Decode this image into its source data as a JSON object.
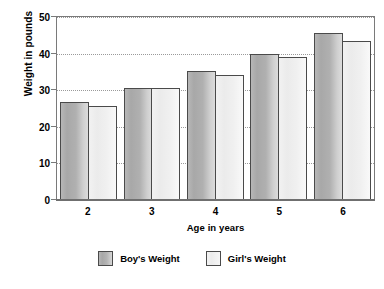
{
  "chart_data": {
    "type": "bar",
    "title": "",
    "xlabel": "Age in years",
    "ylabel": "Weight in pounds",
    "categories": [
      "2",
      "3",
      "4",
      "5",
      "6"
    ],
    "series": [
      {
        "name": "Boy's Weight",
        "values": [
          26.8,
          30.5,
          35.3,
          40.0,
          45.7
        ],
        "color": "#b0b0b0"
      },
      {
        "name": "Girl's Weight",
        "values": [
          25.7,
          30.5,
          34.2,
          39.2,
          43.5
        ],
        "color": "#f0f0f0"
      }
    ],
    "ylim": [
      0,
      50
    ],
    "yticks": [
      "0",
      "10",
      "20",
      "30",
      "40",
      "50"
    ],
    "ytick_values": [
      0,
      10,
      20,
      30,
      40,
      50
    ],
    "grid": true,
    "grid_style": "dotted",
    "legend_position": "bottom-center"
  },
  "axes": {
    "y_title": "Weight in pounds",
    "x_title": "Age in years"
  },
  "legend": {
    "items": [
      {
        "label": "Boy's Weight",
        "swatch": "boy-swatch"
      },
      {
        "label": "Girl's Weight",
        "swatch": "girl-swatch"
      }
    ]
  }
}
